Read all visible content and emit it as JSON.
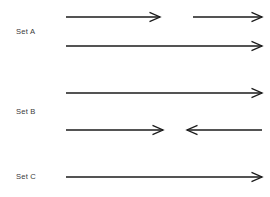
{
  "figure": {
    "width": 270,
    "height": 197,
    "background_color": "#ffffff",
    "line_color": "#1b1b1b",
    "label_color": "#3a3a3a",
    "arrowhead_style": "open-barb"
  },
  "labels": [
    {
      "id": "set-a",
      "text": "Set A",
      "x": 16,
      "y": 32
    },
    {
      "id": "set-b",
      "text": "Set B",
      "x": 16,
      "y": 112
    },
    {
      "id": "set-c",
      "text": "Set C",
      "x": 16,
      "y": 177
    }
  ],
  "rows": [
    {
      "id": "row-1",
      "set": "Set A",
      "y": 17,
      "segments": [
        {
          "id": "row-1-seg-1",
          "from_x": 66,
          "to_x": 160,
          "direction": "right"
        },
        {
          "id": "row-1-seg-2",
          "from_x": 193,
          "to_x": 262,
          "direction": "right"
        }
      ]
    },
    {
      "id": "row-2",
      "set": "Set A",
      "y": 46,
      "segments": [
        {
          "id": "row-2-seg-1",
          "from_x": 66,
          "to_x": 262,
          "direction": "right"
        }
      ]
    },
    {
      "id": "row-3",
      "set": "Set B",
      "y": 93,
      "segments": [
        {
          "id": "row-3-seg-1",
          "from_x": 66,
          "to_x": 262,
          "direction": "right"
        }
      ]
    },
    {
      "id": "row-4",
      "set": "Set B",
      "y": 130,
      "segments": [
        {
          "id": "row-4-seg-1",
          "from_x": 66,
          "to_x": 163,
          "direction": "right"
        },
        {
          "id": "row-4-seg-2",
          "from_x": 262,
          "to_x": 187,
          "direction": "left"
        }
      ]
    },
    {
      "id": "row-5",
      "set": "Set C",
      "y": 177,
      "segments": [
        {
          "id": "row-5-seg-1",
          "from_x": 66,
          "to_x": 262,
          "direction": "right"
        }
      ]
    }
  ]
}
